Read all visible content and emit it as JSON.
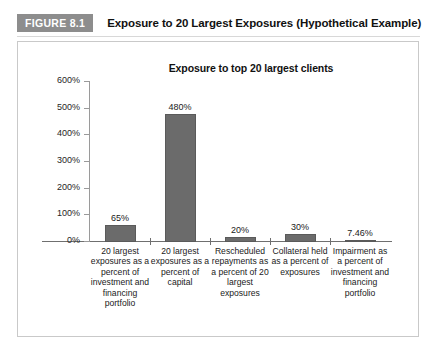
{
  "figure": {
    "badge": "FIGURE 8.1",
    "title": "Exposure to 20 Largest Exposures (Hypothetical Example)"
  },
  "colors": {
    "badge_bg": "#8d8d8d",
    "bar_fill": "#6b6b6b",
    "bar_stroke": "#5a5a5a",
    "frame_border": "#c9c9c9",
    "axis": "#6f6f6f"
  },
  "chart_data": {
    "type": "bar",
    "title": "Exposure to top 20 largest clients",
    "xlabel": "",
    "ylabel": "",
    "ylim": [
      0,
      600
    ],
    "grid": false,
    "legend": "none",
    "ytick_labels": [
      "600%",
      "500%",
      "400%",
      "300%",
      "200%",
      "100%",
      "0%"
    ],
    "ytick_values": [
      600,
      500,
      400,
      300,
      200,
      100,
      0
    ],
    "categories": [
      "20 largest exposures as a percent of investment and financing portfolio",
      "20 largest exposures as a percent of capital",
      "Rescheduled repayments as a percent of 20 largest exposures",
      "Collateral held as a percent of exposures",
      "Impairment as a percent of investment and financing portfolio"
    ],
    "values": [
      65,
      480,
      20,
      30,
      7.46
    ],
    "value_labels": [
      "65%",
      "480%",
      "20%",
      "30%",
      "7.46%"
    ]
  }
}
